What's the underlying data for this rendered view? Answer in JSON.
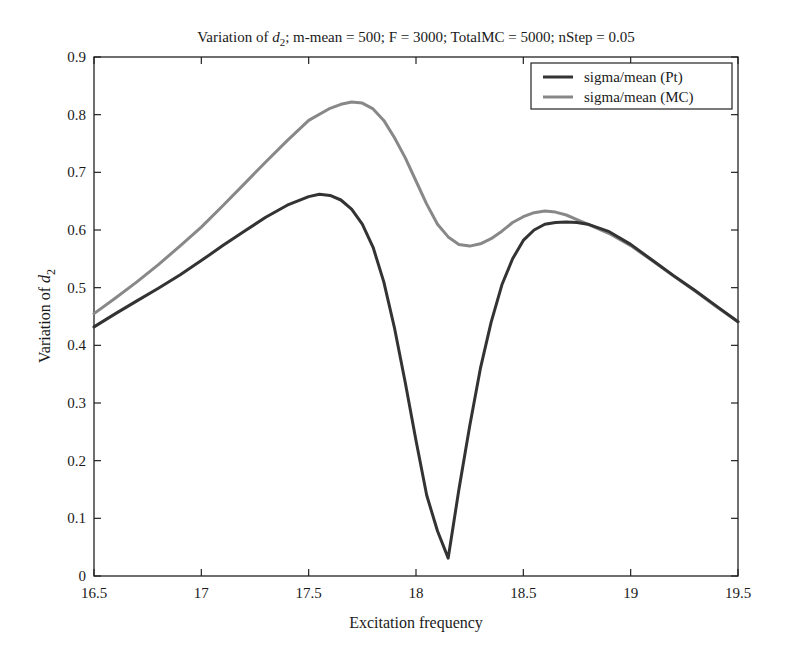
{
  "chart_data": {
    "type": "line",
    "title": "Variation of d2; m-mean = 500; F = 3000; TotalMC = 5000; nStep = 0.05",
    "title_parts": {
      "prefix": "Variation of ",
      "var": "d",
      "sub": "2",
      "suffix": "; m-mean = 500; F = 3000; TotalMC = 5000; nStep = 0.05"
    },
    "xlabel": "Excitation frequency",
    "ylabel": "Variation of d2",
    "ylabel_parts": {
      "prefix": "Variation of ",
      "var": "d",
      "sub": "2"
    },
    "xlim": [
      16.5,
      19.5
    ],
    "ylim": [
      0,
      0.9
    ],
    "xticks": [
      16.5,
      17,
      17.5,
      18,
      18.5,
      19,
      19.5
    ],
    "xtick_labels": [
      "16.5",
      "17",
      "17.5",
      "18",
      "18.5",
      "19",
      "19.5"
    ],
    "yticks": [
      0,
      0.1,
      0.2,
      0.3,
      0.4,
      0.5,
      0.6,
      0.7,
      0.8,
      0.9
    ],
    "ytick_labels": [
      "0",
      "0.1",
      "0.2",
      "0.3",
      "0.4",
      "0.5",
      "0.6",
      "0.7",
      "0.8",
      "0.9"
    ],
    "grid": false,
    "legend_position": "upper right",
    "series": [
      {
        "name": "sigma/mean (Pt)",
        "color": "#333333",
        "x": [
          16.5,
          16.6,
          16.7,
          16.8,
          16.9,
          17.0,
          17.1,
          17.2,
          17.3,
          17.4,
          17.5,
          17.55,
          17.6,
          17.65,
          17.7,
          17.75,
          17.8,
          17.85,
          17.9,
          17.95,
          18.0,
          18.05,
          18.1,
          18.15,
          18.2,
          18.25,
          18.3,
          18.35,
          18.4,
          18.45,
          18.5,
          18.55,
          18.6,
          18.65,
          18.7,
          18.75,
          18.8,
          18.9,
          19.0,
          19.1,
          19.2,
          19.3,
          19.4,
          19.5
        ],
        "values": [
          0.432,
          0.455,
          0.477,
          0.499,
          0.522,
          0.547,
          0.573,
          0.598,
          0.622,
          0.643,
          0.658,
          0.662,
          0.66,
          0.652,
          0.636,
          0.61,
          0.57,
          0.51,
          0.43,
          0.335,
          0.235,
          0.14,
          0.078,
          0.031,
          0.15,
          0.26,
          0.36,
          0.44,
          0.505,
          0.55,
          0.582,
          0.6,
          0.61,
          0.613,
          0.614,
          0.613,
          0.61,
          0.597,
          0.575,
          0.548,
          0.521,
          0.495,
          0.468,
          0.441
        ]
      },
      {
        "name": "sigma/mean (MC)",
        "color": "#888888",
        "x": [
          16.5,
          16.6,
          16.7,
          16.8,
          16.9,
          17.0,
          17.1,
          17.2,
          17.3,
          17.4,
          17.5,
          17.6,
          17.65,
          17.7,
          17.75,
          17.8,
          17.85,
          17.9,
          17.95,
          18.0,
          18.05,
          18.1,
          18.15,
          18.2,
          18.25,
          18.3,
          18.35,
          18.4,
          18.45,
          18.5,
          18.55,
          18.6,
          18.65,
          18.7,
          18.75,
          18.8,
          18.9,
          19.0,
          19.1,
          19.2,
          19.3,
          19.4,
          19.5
        ],
        "values": [
          0.455,
          0.482,
          0.51,
          0.54,
          0.572,
          0.605,
          0.642,
          0.68,
          0.718,
          0.755,
          0.79,
          0.811,
          0.818,
          0.822,
          0.82,
          0.81,
          0.79,
          0.76,
          0.725,
          0.685,
          0.645,
          0.61,
          0.588,
          0.575,
          0.572,
          0.576,
          0.585,
          0.598,
          0.613,
          0.623,
          0.63,
          0.633,
          0.631,
          0.626,
          0.618,
          0.61,
          0.594,
          0.573,
          0.547,
          0.52,
          0.494,
          0.467,
          0.441
        ]
      }
    ]
  }
}
